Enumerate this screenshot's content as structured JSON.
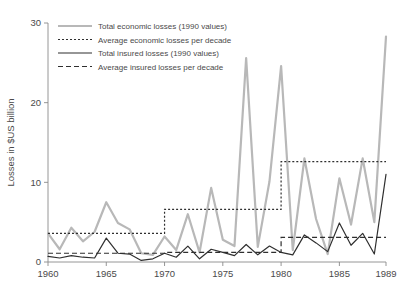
{
  "chart_data": {
    "type": "line",
    "title": "",
    "xlabel": "",
    "ylabel": "Losses in $US billion",
    "xlim": [
      1960,
      1989
    ],
    "ylim": [
      0,
      30
    ],
    "grid": false,
    "legend_position": "top-left",
    "xticks": [
      1960,
      1965,
      1970,
      1975,
      1980,
      1985,
      1989
    ],
    "yticks": [
      0,
      10,
      20,
      30
    ],
    "x": [
      1960,
      1961,
      1962,
      1963,
      1964,
      1965,
      1966,
      1967,
      1968,
      1969,
      1970,
      1971,
      1972,
      1973,
      1974,
      1975,
      1976,
      1977,
      1978,
      1979,
      1980,
      1981,
      1982,
      1983,
      1984,
      1985,
      1986,
      1987,
      1988,
      1989
    ],
    "series": [
      {
        "name": "Total economic losses (1990 values)",
        "style": "solid",
        "color": "#b8b8b8",
        "width": 2.2,
        "values": [
          3.6,
          1.6,
          4.3,
          2.6,
          3.8,
          7.5,
          4.9,
          4.1,
          1.1,
          0.9,
          3.2,
          1.5,
          6.0,
          1.2,
          9.3,
          2.8,
          2.0,
          25.6,
          1.9,
          10.1,
          24.6,
          1.5,
          13.0,
          5.4,
          1.0,
          10.5,
          4.7,
          13.0,
          5.0,
          28.3
        ]
      },
      {
        "name": "Average economic losses per decade",
        "style": "dotted",
        "color": "#2f2f2f",
        "width": 1.2,
        "step_segments": [
          {
            "from": 1960,
            "to": 1970,
            "value": 3.6
          },
          {
            "from": 1970,
            "to": 1980,
            "value": 6.6
          },
          {
            "from": 1980,
            "to": 1989,
            "value": 12.6
          }
        ]
      },
      {
        "name": "Total insured losses (1990 values)",
        "style": "solid",
        "color": "#2f2f2f",
        "width": 1.2,
        "values": [
          0.7,
          0.5,
          0.8,
          0.6,
          0.5,
          3.0,
          1.1,
          1.0,
          0.2,
          0.4,
          1.1,
          0.6,
          2.0,
          0.4,
          1.6,
          1.2,
          0.8,
          2.2,
          0.9,
          2.0,
          1.2,
          0.9,
          3.4,
          2.4,
          1.3,
          4.9,
          2.1,
          3.6,
          1.0,
          11.0
        ]
      },
      {
        "name": "Average insured losses per decade",
        "style": "dashed",
        "color": "#2f2f2f",
        "width": 1.2,
        "step_segments": [
          {
            "from": 1960,
            "to": 1970,
            "value": 1.1
          },
          {
            "from": 1970,
            "to": 1980,
            "value": 1.2
          },
          {
            "from": 1980,
            "to": 1989,
            "value": 3.1
          }
        ]
      }
    ]
  },
  "legend": {
    "items": [
      {
        "label": "Total economic losses (1990 values)",
        "swatch": "solid-gray"
      },
      {
        "label": "Average economic losses per decade",
        "swatch": "dotted-dark"
      },
      {
        "label": "Total insured losses (1990 values)",
        "swatch": "solid-dark"
      },
      {
        "label": "Average insured losses per decade",
        "swatch": "dashed-dark"
      }
    ]
  },
  "axes": {
    "y_title": "Losses in $US billion",
    "y_tick_labels": [
      "0",
      "10",
      "20",
      "30"
    ],
    "x_tick_labels": [
      "1960",
      "1965",
      "1970",
      "1975",
      "1980",
      "1985",
      "1989"
    ]
  },
  "colors": {
    "economic_line": "#b8b8b8",
    "insured_line": "#2f2f2f",
    "axis": "#8a8a8a",
    "text": "#4a4a4a",
    "background": "#ffffff"
  }
}
